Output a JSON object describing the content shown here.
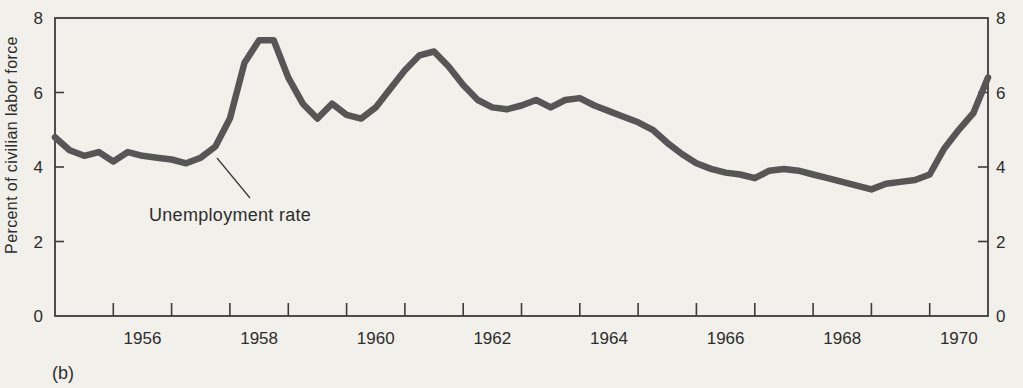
{
  "colors": {
    "background": "#f2f0ea",
    "line": "#565656",
    "axis": "#3c3c3c",
    "text": "#2d2d2d"
  },
  "figure": {
    "panel_label": "(b)",
    "y_axis_label": "Percent of civilian labor force",
    "annotation_label": "Unemployment rate"
  },
  "chart_data": {
    "type": "line",
    "title": "",
    "xlabel": "",
    "ylabel": "Percent of civilian labor force",
    "xlim": [
      1955,
      1971
    ],
    "ylim": [
      0,
      8
    ],
    "grid": false,
    "legend_position": "none (in-plot annotation with leader line)",
    "y_ticks": [
      0,
      2,
      4,
      6,
      8
    ],
    "y_inner_ticks": [
      2,
      4,
      6
    ],
    "y_axis_sides": [
      "left",
      "right"
    ],
    "x_ticks": [
      1956,
      1957,
      1958,
      1959,
      1960,
      1961,
      1962,
      1963,
      1964,
      1965,
      1966,
      1967,
      1968,
      1969,
      1970
    ],
    "x_tick_labels": [
      {
        "label": "1956",
        "x": 1956.5
      },
      {
        "label": "1958",
        "x": 1958.5
      },
      {
        "label": "1960",
        "x": 1960.5
      },
      {
        "label": "1962",
        "x": 1962.5
      },
      {
        "label": "1964",
        "x": 1964.5
      },
      {
        "label": "1966",
        "x": 1966.5
      },
      {
        "label": "1968",
        "x": 1968.5
      },
      {
        "label": "1970",
        "x": 1970.5
      }
    ],
    "series": [
      {
        "name": "Unemployment rate",
        "x": [
          1955,
          1955.25,
          1955.5,
          1955.75,
          1956,
          1956.25,
          1956.5,
          1956.75,
          1957,
          1957.25,
          1957.5,
          1957.75,
          1958,
          1958.25,
          1958.5,
          1958.75,
          1959,
          1959.25,
          1959.5,
          1959.75,
          1960,
          1960.25,
          1960.5,
          1960.75,
          1961,
          1961.25,
          1961.5,
          1961.75,
          1962,
          1962.25,
          1962.5,
          1962.75,
          1963,
          1963.25,
          1963.5,
          1963.75,
          1964,
          1964.25,
          1964.5,
          1964.75,
          1965,
          1965.25,
          1965.5,
          1965.75,
          1966,
          1966.25,
          1966.5,
          1966.75,
          1967,
          1967.25,
          1967.5,
          1967.75,
          1968,
          1968.25,
          1968.5,
          1968.75,
          1969,
          1969.25,
          1969.5,
          1969.75,
          1970,
          1970.25,
          1970.5,
          1970.75,
          1971
        ],
        "values": [
          4.8,
          4.45,
          4.3,
          4.4,
          4.15,
          4.4,
          4.3,
          4.25,
          4.2,
          4.1,
          4.25,
          4.55,
          5.3,
          6.8,
          7.4,
          7.4,
          6.4,
          5.7,
          5.3,
          5.7,
          5.4,
          5.3,
          5.6,
          6.1,
          6.6,
          7.0,
          7.1,
          6.7,
          6.2,
          5.8,
          5.6,
          5.55,
          5.65,
          5.8,
          5.6,
          5.8,
          5.85,
          5.65,
          5.5,
          5.35,
          5.2,
          5.0,
          4.65,
          4.35,
          4.1,
          3.95,
          3.85,
          3.8,
          3.7,
          3.9,
          3.95,
          3.9,
          3.8,
          3.7,
          3.6,
          3.5,
          3.4,
          3.55,
          3.6,
          3.65,
          3.8,
          4.5,
          5.0,
          5.45,
          6.4
        ]
      }
    ]
  }
}
